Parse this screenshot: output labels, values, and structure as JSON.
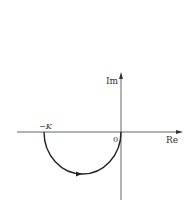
{
  "diagram": {
    "type": "nyquist-plot",
    "axes": {
      "real_label": "Re",
      "imag_label": "Im",
      "origin_label": "0"
    },
    "points": {
      "start_label": "−K"
    },
    "curve": {
      "shape": "lower-semicircle",
      "from": "-K",
      "to": "0",
      "direction_arrow": "left-to-right"
    },
    "colors": {
      "axis": "#444444",
      "curve": "#222222",
      "text": "#333333",
      "background": "#ffffff"
    }
  }
}
